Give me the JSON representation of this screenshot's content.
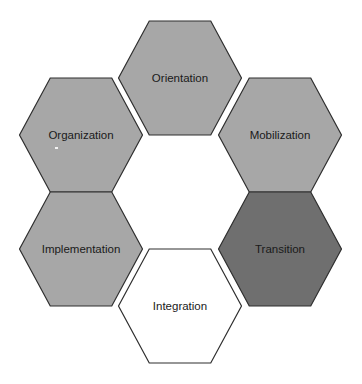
{
  "diagram": {
    "type": "hexagon-ring",
    "colors": {
      "light": "#a7a7a7",
      "dark": "#6f6f6f",
      "white": "#ffffff",
      "stroke": "#2e2e2e"
    },
    "hexagons": [
      {
        "label": "Orientation",
        "cx": 180,
        "cy": 78,
        "fill": "#a7a7a7"
      },
      {
        "label": "Organization",
        "cx": 81,
        "cy": 135,
        "fill": "#a7a7a7"
      },
      {
        "label": "Mobilization",
        "cx": 280,
        "cy": 135,
        "fill": "#a7a7a7"
      },
      {
        "label": "Implementation",
        "cx": 81,
        "cy": 249,
        "fill": "#a7a7a7"
      },
      {
        "label": "Transition",
        "cx": 280,
        "cy": 249,
        "fill": "#6f6f6f"
      },
      {
        "label": "Integration",
        "cx": 180,
        "cy": 306,
        "fill": "#ffffff"
      }
    ]
  }
}
